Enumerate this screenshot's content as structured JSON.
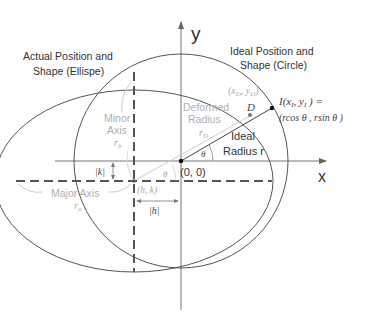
{
  "diagram": {
    "axes": {
      "x_label": "x",
      "y_label": "y",
      "origin_label": "(0, 0)"
    },
    "labels": {
      "actual_line1": "Actual Position and",
      "actual_line2": "Shape (Ellispe)",
      "ideal_line1": "Ideal Position and",
      "ideal_line2": "Shape (Circle)",
      "minor_line1": "Minor",
      "minor_line2": "Axis",
      "minor_sym": "r",
      "minor_sub": "b",
      "major": "Major Axis",
      "major_sym": "r",
      "major_sub": "a",
      "deformed_line1": "Deformed",
      "deformed_line2": "Radius",
      "deformed_sym": "r",
      "deformed_sub": "D",
      "ideal_radius_line1": "Ideal",
      "ideal_radius_line2": "Radius r",
      "theta": "θ",
      "center": "(h, k)",
      "abs_k": "|k|",
      "abs_h": "|h|",
      "point_d_coords": "(x_D, y_D)",
      "point_d": "D",
      "point_i_line1": "I(x_I, y_I) =",
      "point_i_line2": "(rcos θ , rsin θ )"
    },
    "colors": {
      "line": "#555555",
      "faint": "#bbbbbb",
      "dash": "#555555"
    }
  }
}
